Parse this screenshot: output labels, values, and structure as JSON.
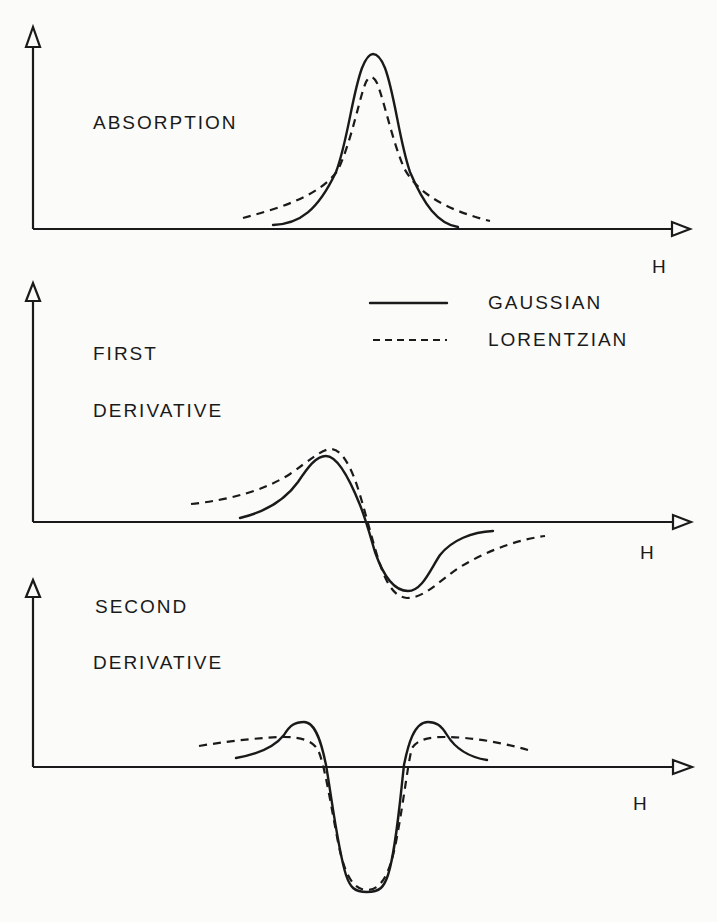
{
  "panels": [
    {
      "id": "absorption",
      "label_lines": [
        "ABSORPTION"
      ],
      "x_axis_label": "H"
    },
    {
      "id": "first-derivative",
      "label_lines": [
        "FIRST",
        "DERIVATIVE"
      ],
      "x_axis_label": "H"
    },
    {
      "id": "second-derivative",
      "label_lines": [
        "SECOND",
        "DERIVATIVE"
      ],
      "x_axis_label": "H"
    }
  ],
  "legend": {
    "items": [
      {
        "label": "GAUSSIAN",
        "style": "solid"
      },
      {
        "label": "LORENTZIAN",
        "style": "dashed"
      }
    ]
  },
  "colors": {
    "line": "#1a1a1a",
    "background": "#fbfbf9"
  }
}
